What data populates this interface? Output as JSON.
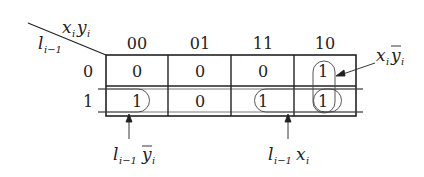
{
  "kmap": {
    "corner": {
      "col_var": "x",
      "col_var_sub": "i",
      "col_var2": "y",
      "col_var2_sub": "i",
      "row_var": "l",
      "row_var_sub": "i−1"
    },
    "col_headers": [
      "00",
      "01",
      "11",
      "10"
    ],
    "row_headers": [
      "0",
      "1"
    ],
    "cells": [
      [
        "0",
        "0",
        "0",
        "1"
      ],
      [
        "1",
        "0",
        "1",
        "1"
      ]
    ],
    "annotations": {
      "top_right": {
        "base": "x",
        "base_sub": "i",
        "bar": "y",
        "bar_sub": "i"
      },
      "bottom_left": {
        "base": "l",
        "base_sub": "i−1",
        "bar": "y",
        "bar_sub": "i"
      },
      "bottom_right": {
        "base": "l",
        "base_sub": "i−1",
        "tail": "x",
        "tail_sub": "i"
      }
    }
  }
}
